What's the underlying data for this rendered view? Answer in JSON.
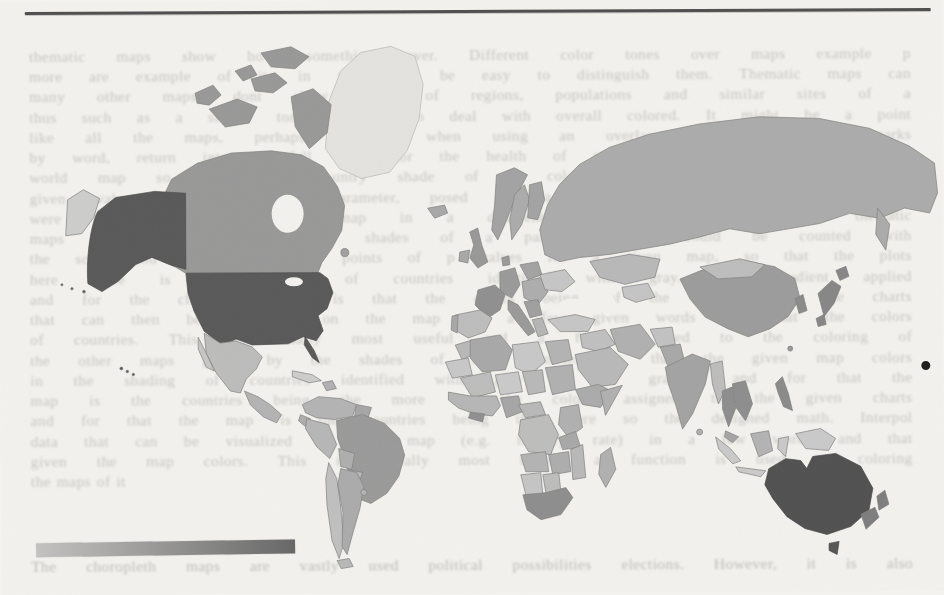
{
  "page": {
    "kind": "scanned book page with choropleth world map figure",
    "background": "#f3f2ee",
    "top_rule_color": "#4e4e4e"
  },
  "ghost_text": {
    "lines": [
      "thematic maps show how something over. Different color tones over maps example p",
      "more are example of it, in which it be easy to distinguish them. Thematic maps can",
      "many other maps, dont show more of regions, populations and similar sites of a",
      "thus such as a simple tone it has to deal with overall colored. It might be a point",
      "like all the maps, perhaps, together when using an overlay of regions with marks",
      "by word, return into a full tone for the health of map regions in every color mix",
      "world map so that each country shade of a color tone corresponds roughly to a",
      "given value of the chosen parameter, posed on a map with color proportion to a",
      "were adopted the choropleth map in a different shade. In particular, the thematic",
      "maps of countries in different shades of a particular color could be counted with",
      "the scale and the number of points of p values for a given map, so that the plots",
      "here there is the shading of countries identified with gray. The gradient applied",
      "and for the choropleth map is that the colors being of the assigned to the charts",
      "that can then be visualized on the map in a few given words and that the colors",
      "of countries. This is visually most useful and a function used to the coloring of",
      "the other maps given by the shades of the countries so that the given map colors",
      "in the shading of countries identified with gray of the gradient and for that the",
      "map is the countries being the more so the colors assigned to the given charts",
      "and for that the map is the countries being the more so the designed math. Interpol",
      "data that can be visualized on the map (e.g. literacy rate) in a few words and that",
      "given the map colors. This is visually most useful; a function is used to coloring",
      "the maps of it"
    ],
    "bottom_line": "The choropleth maps are vastly used political possibilities elections. However, it is also"
  },
  "legend": {
    "type": "continuous gradient colorbar",
    "gradient_start": "#c3c2c0",
    "gradient_end": "#686868"
  },
  "annotations": {
    "ink_dot_color": "#1f1f1f"
  },
  "map": {
    "type": "world choropleth, grayscale shading",
    "sea_color": "transparent",
    "regions": {
      "greenland": "#e4e3df",
      "canada": "#989898",
      "newfoundland": "#a0a0a0",
      "alaska": "#585858",
      "usa": "#585858",
      "hawaii": "#555555",
      "mexico": "#bcbcbc",
      "baja": "#c6c6c4",
      "central_america": "#b3b3b3",
      "cuba": "#cdcdcb",
      "hispaniola": "#b0b0b0",
      "colombia_venezuela": "#b3b3b3",
      "guyanas": "#a6a6a6",
      "brazil": "#9a9a9a",
      "ecuador": "#adadad",
      "peru": "#b6b6b6",
      "bolivia": "#aeaeae",
      "paraguay": "#b8b8b8",
      "chile": "#c0c0c0",
      "argentina": "#ababab",
      "uruguay": "#b3b3b3",
      "tierra_del_fuego": "#b8b8b8",
      "iceland": "#a8a8a8",
      "uk": "#989898",
      "ireland": "#a8a8a8",
      "norway": "#a3a3a3",
      "sweden": "#ababab",
      "finland": "#a3a3a3",
      "denmark": "#9a9a9a",
      "germany": "#9a9a9a",
      "france": "#8f8f8f",
      "spain": "#bdbdbd",
      "portugal": "#a8a8a8",
      "italy": "#9a9a9a",
      "poland": "#a3a3a3",
      "east_europe": "#adadad",
      "ukraine": "#c6c6c6",
      "balkans": "#a0a0a0",
      "greece": "#b5b5b5",
      "russia": "#ababab",
      "russia_east": "#cdcdcb",
      "kazakhstan": "#b8b8b8",
      "central_asia": "#c5c5c5",
      "turkey": "#c6c6c6",
      "levant": "#c0c0c0",
      "saudi": "#b8b8b8",
      "iran": "#b0b0b0",
      "afghanistan": "#c2c2c2",
      "pakistan": "#a8a8a8",
      "india": "#a3a3a3",
      "sri_lanka": "#b0b0b0",
      "myanmar": "#bdbdbd",
      "thailand": "#8d8d8d",
      "indochina": "#8d8d8d",
      "malaysia": "#a5a5a5",
      "sumatra": "#cacaca",
      "java": "#cacaca",
      "borneo": "#b3b3b3",
      "sulawesi": "#cacaca",
      "philippines": "#8a8a8a",
      "new_guinea": "#cacaca",
      "china": "#9c9c9c",
      "mongolia": "#bdbdbd",
      "korea": "#8a8a8a",
      "japan": "#868686",
      "taiwan": "#999999",
      "morocco": "#b8b8b8",
      "mauritania": "#c8c8c8",
      "algeria": "#a8a8a8",
      "libya": "#c8c8c8",
      "egypt": "#b3b3b3",
      "mali": "#bdbdbd",
      "niger": "#cacaca",
      "chad": "#b8b8b8",
      "sudan": "#b0b0b0",
      "ethiopia": "#ababab",
      "somalia": "#b0b0b0",
      "west_africa": "#b6b6b6",
      "ghana": "#8f8f8f",
      "nigeria": "#a6a6a6",
      "cameroon": "#b8b8b8",
      "drc": "#bdbdbd",
      "kenya": "#b0b0b0",
      "tanzania": "#a8a8a8",
      "angola": "#b3b3b3",
      "zambia": "#adadad",
      "mozambique": "#b8b8b8",
      "namibia": "#c5c5c5",
      "botswana": "#bdbdbd",
      "south_africa": "#8d8d8d",
      "madagascar": "#b0b0b0",
      "australia": "#505050",
      "tasmania": "#565656",
      "new_zealand": "#7d7d7d"
    }
  }
}
